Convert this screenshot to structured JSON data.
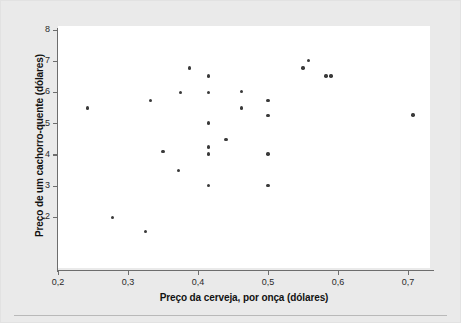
{
  "figure": {
    "background_color": "#eaeaea",
    "plot_background_color": "#ffffff",
    "axis_color": "#6d6d6d",
    "point_color": "#3a3a3a"
  },
  "chart_data": {
    "type": "scatter",
    "title": "",
    "xlabel": "Preço da cerveja, por onça (dólares)",
    "ylabel": "Preço de um cachorro-quente (dólares)",
    "xlim": [
      0.2,
      0.75
    ],
    "ylim": [
      1.2,
      8.2
    ],
    "grid": false,
    "legend": null,
    "xticks": [
      0.2,
      0.3,
      0.4,
      0.5,
      0.6,
      0.7
    ],
    "xticklabels": [
      "0,2",
      "0,3",
      "0,4",
      "0,5",
      "0,6",
      "0,7"
    ],
    "yticks": [
      2,
      3,
      4,
      5,
      6,
      7,
      8
    ],
    "yticklabels": [
      "2",
      "3",
      "4",
      "5",
      "6",
      "7",
      "8"
    ],
    "points": [
      {
        "x": 0.242,
        "y": 5.5
      },
      {
        "x": 0.278,
        "y": 2.0
      },
      {
        "x": 0.325,
        "y": 1.55
      },
      {
        "x": 0.332,
        "y": 5.75
      },
      {
        "x": 0.35,
        "y": 4.1
      },
      {
        "x": 0.372,
        "y": 3.5
      },
      {
        "x": 0.375,
        "y": 6.0
      },
      {
        "x": 0.388,
        "y": 6.78
      },
      {
        "x": 0.415,
        "y": 6.52
      },
      {
        "x": 0.415,
        "y": 6.0
      },
      {
        "x": 0.415,
        "y": 5.02
      },
      {
        "x": 0.415,
        "y": 4.25
      },
      {
        "x": 0.415,
        "y": 4.02
      },
      {
        "x": 0.415,
        "y": 3.02
      },
      {
        "x": 0.44,
        "y": 4.5
      },
      {
        "x": 0.462,
        "y": 6.02
      },
      {
        "x": 0.462,
        "y": 5.5
      },
      {
        "x": 0.5,
        "y": 5.75
      },
      {
        "x": 0.5,
        "y": 5.25
      },
      {
        "x": 0.5,
        "y": 4.03
      },
      {
        "x": 0.5,
        "y": 3.02
      },
      {
        "x": 0.55,
        "y": 6.78
      },
      {
        "x": 0.558,
        "y": 7.02
      },
      {
        "x": 0.583,
        "y": 6.52
      },
      {
        "x": 0.59,
        "y": 6.52
      },
      {
        "x": 0.707,
        "y": 5.27
      }
    ]
  }
}
